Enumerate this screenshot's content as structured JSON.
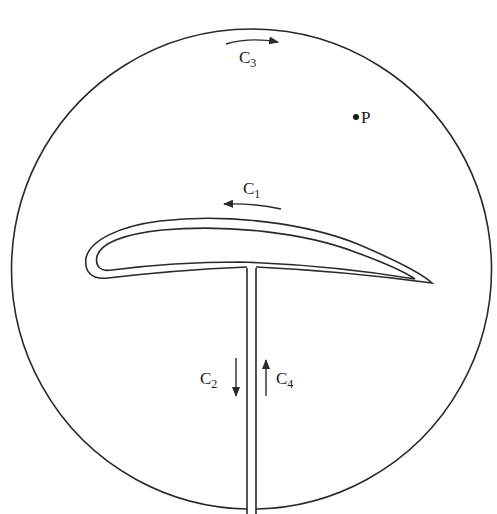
{
  "diagram": {
    "colors": {
      "stroke": "#2a2a2a",
      "background": "#ffffff"
    },
    "labels": {
      "c1": {
        "main": "C",
        "sub": "1"
      },
      "c2": {
        "main": "C",
        "sub": "2"
      },
      "c3": {
        "main": "C",
        "sub": "3"
      },
      "c4": {
        "main": "C",
        "sub": "4"
      },
      "p": "P"
    },
    "arrows": {
      "c1": "left",
      "c2": "down",
      "c3": "right",
      "c4": "up"
    }
  }
}
